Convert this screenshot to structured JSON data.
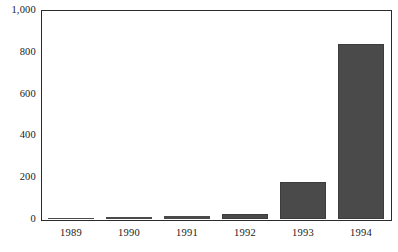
{
  "chart_data": {
    "type": "bar",
    "title": "",
    "subtitle": "",
    "xlabel": "",
    "ylabel": "",
    "categories": [
      "1989",
      "1990",
      "1991",
      "1992",
      "1993",
      "1994"
    ],
    "values": [
      5,
      10,
      14,
      26,
      180,
      840
    ],
    "series": [
      {
        "name": "",
        "values": [
          5,
          10,
          14,
          26,
          180,
          840
        ]
      }
    ],
    "ylim": [
      0,
      1000
    ],
    "yticks": [
      0,
      200,
      400,
      600,
      800,
      1000
    ],
    "ytick_labels": [
      "0",
      "200",
      "400",
      "600",
      "800",
      "1,000"
    ],
    "grid": false,
    "legend": false,
    "legend_position": "none",
    "bar_color": "#4a4a4a",
    "frame_color": "#2b2b2b",
    "background": "#ffffff",
    "annotations": []
  }
}
